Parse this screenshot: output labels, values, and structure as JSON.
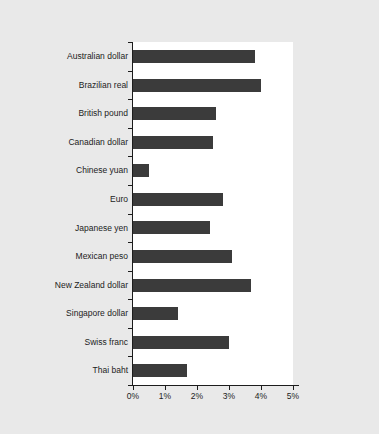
{
  "chart_data": {
    "type": "bar",
    "orientation": "horizontal",
    "title": "",
    "xlabel": "",
    "ylabel": "",
    "xlim": [
      0,
      5
    ],
    "xunit": "%",
    "grid": false,
    "legend": null,
    "bar_color": "#3b3b3b",
    "plot_background": "#ffffff",
    "figure_background": "#e9e9e9",
    "xticks": [
      "0%",
      "1%",
      "2%",
      "3%",
      "4%",
      "5%"
    ],
    "xtick_values": [
      0,
      1,
      2,
      3,
      4,
      5
    ],
    "categories": [
      "Australian dollar",
      "Brazilian real",
      "British pound",
      "Canadian dollar",
      "Chinese yuan",
      "Euro",
      "Japanese yen",
      "Mexican peso",
      "New Zealand dollar",
      "Singapore dollar",
      "Swiss franc",
      "Thai baht"
    ],
    "values": [
      3.8,
      4.0,
      2.6,
      2.5,
      0.5,
      2.8,
      2.4,
      3.1,
      3.7,
      1.4,
      3.0,
      1.7
    ]
  }
}
